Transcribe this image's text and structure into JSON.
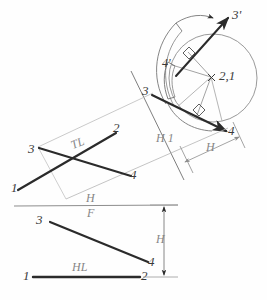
{
  "drawing": {
    "title": "Descriptive geometry construction: true length and rotation of a line",
    "background_color": "#fefefe",
    "ink_color": "#2b2b2b",
    "light_ink_color": "#9a9a9a",
    "construction_color": "#b4b4b4"
  },
  "labels": {
    "point_3_prime": "3'",
    "point_4_prime": "4'",
    "center_2_1": "2,1",
    "top_point_3": "3",
    "top_point_4": "4",
    "aux_fold_line": "H 1",
    "aux_dimension_h": "H",
    "true_length": "TL",
    "plan_point_3": "3",
    "plan_point_2": "2",
    "plan_point_1": "1",
    "plan_point_4": "4",
    "fold_h": "H",
    "fold_f": "F",
    "front_point_3": "3",
    "front_point_4": "4",
    "front_point_1": "1",
    "front_point_2": "2",
    "horizontal_line": "HL",
    "front_dimension_h": "H"
  },
  "geometry": {
    "circle": {
      "cx": 213,
      "cy": 78,
      "r": 44
    },
    "plan_line_1_2": {
      "x1": 18,
      "y1": 190,
      "x2": 115,
      "y2": 133
    },
    "plan_line_3_4": {
      "x1": 38,
      "y1": 147,
      "x2": 132,
      "y2": 175
    },
    "top_line_3_4": {
      "x1": 152,
      "y1": 94,
      "x2": 225,
      "y2": 131
    },
    "rotated_line_3p": {
      "x1": 181,
      "y1": 80,
      "x2": 228,
      "y2": 18
    },
    "front_line_3_4": {
      "x1": 50,
      "y1": 222,
      "x2": 148,
      "y2": 262
    },
    "front_line_1_2": {
      "x1": 33,
      "y1": 277,
      "x2": 140,
      "y2": 277
    },
    "fold_hf_line": {
      "x1": 14,
      "y1": 207,
      "x2": 178,
      "y2": 206
    },
    "fold_h1_line": {
      "x1": 132,
      "y1": 72,
      "x2": 184,
      "y2": 179
    }
  }
}
